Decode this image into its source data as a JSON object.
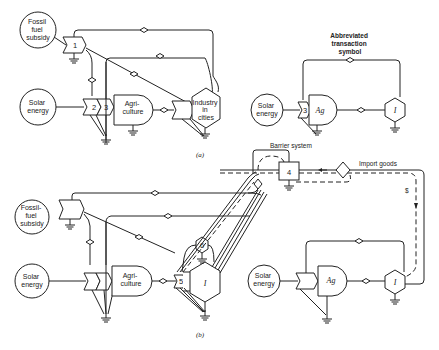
{
  "diagram_a": {
    "caption": "(a)",
    "fossil_fuel": [
      "Fossil",
      "fuel",
      "subsidy"
    ],
    "solar": [
      "Solar",
      "energy"
    ],
    "agriculture": [
      "Agri-",
      "culture"
    ],
    "industry": [
      "Industry",
      "in",
      "cities"
    ],
    "numbers": {
      "n1": "1",
      "n2": "2",
      "n3": "3"
    }
  },
  "abbreviated": {
    "title": [
      "Abbreviated",
      "transaction",
      "symbol"
    ],
    "solar": [
      "Solar",
      "energy"
    ],
    "ag": "Ag",
    "industry": "I",
    "number": "3"
  },
  "diagram_b": {
    "caption": "(b)",
    "fossil_fuel": [
      "Fossil-",
      "fuel",
      "subsidy"
    ],
    "solar": [
      "Solar",
      "energy"
    ],
    "agriculture": [
      "Agri-",
      "culture"
    ],
    "industry": "I",
    "numbers": {
      "n4": "4",
      "n5": "5",
      "n6": "6"
    },
    "barrier": "Barrier system",
    "import": "Import goods",
    "money": "$",
    "solar2": [
      "Solar",
      "energy"
    ],
    "ag2": "Ag",
    "industry2": "I"
  }
}
